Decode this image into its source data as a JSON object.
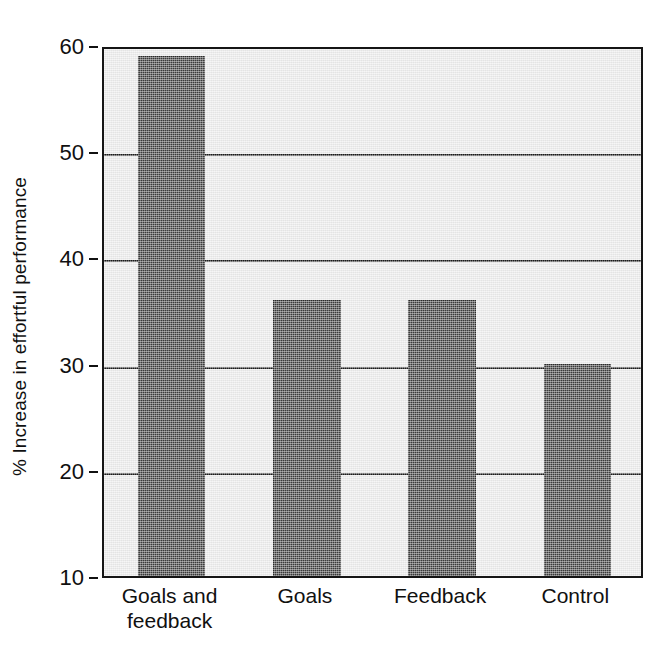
{
  "chart_data": {
    "type": "bar",
    "title": "",
    "xlabel": "",
    "ylabel": "% Increase in effortful performance",
    "categories": [
      "Goals and feedback",
      "Goals",
      "Feedback",
      "Control"
    ],
    "category_lines": [
      [
        "Goals and",
        "feedback"
      ],
      [
        "Goals"
      ],
      [
        "Feedback"
      ],
      [
        "Control"
      ]
    ],
    "values": [
      59,
      36,
      36,
      30
    ],
    "ylim": [
      10,
      60
    ],
    "yticks": [
      10,
      20,
      30,
      40,
      50,
      60
    ],
    "ytick_labels": [
      "10",
      "20",
      "30",
      "40",
      "50",
      "60"
    ],
    "grid": true,
    "grid_axis": "y",
    "legend": "none",
    "bar_color": "#3b3b3b",
    "plot_background": "#e9e9e9",
    "axis_color": "#151515",
    "bar_width_fraction": 0.5
  }
}
